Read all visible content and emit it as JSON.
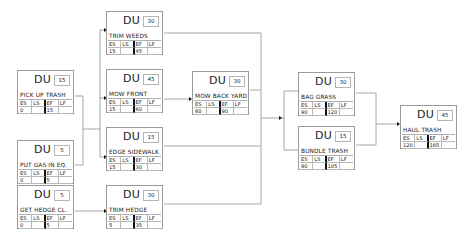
{
  "diagram": {
    "type": "activity-on-node network",
    "field_labels": {
      "du": "DU",
      "es": "ES",
      "ls": "LS",
      "ef": "EF",
      "lf": "LF"
    },
    "nodes": [
      {
        "id": "pick_up_trash",
        "name": "PICK UP TRASH",
        "du": "15",
        "es": "0",
        "ls": "",
        "ef": "15",
        "lf": "",
        "x": 17,
        "y": 70
      },
      {
        "id": "put_gas",
        "name": "PUT GAS IN EQ.",
        "du": "5",
        "es": "0",
        "ls": "",
        "ef": "5",
        "lf": "",
        "x": 17,
        "y": 140
      },
      {
        "id": "get_hedge",
        "name": "GET HEDGE CL.",
        "du": "5",
        "es": "0",
        "ls": "",
        "ef": "5",
        "lf": "",
        "x": 17,
        "y": 185
      },
      {
        "id": "trim_weeds",
        "name": "TRIM WEEDS",
        "du": "30",
        "es": "15",
        "ls": "",
        "ef": "45",
        "lf": "",
        "x": 106,
        "y": 11
      },
      {
        "id": "mow_front",
        "name": "MOW FRONT",
        "du": "45",
        "es": "15",
        "ls": "",
        "ef": "60",
        "lf": "",
        "x": 106,
        "y": 69
      },
      {
        "id": "edge_sidewalk",
        "name": "EDGE SIDEWALK",
        "du": "15",
        "es": "15",
        "ls": "",
        "ef": "30",
        "lf": "",
        "x": 106,
        "y": 127
      },
      {
        "id": "trim_hedge",
        "name": "TRIM HEDGE",
        "du": "30",
        "es": "5",
        "ls": "",
        "ef": "35",
        "lf": "",
        "x": 106,
        "y": 185
      },
      {
        "id": "mow_back_yard",
        "name": "MOW BACK YARD",
        "du": "30",
        "es": "60",
        "ls": "",
        "ef": "90",
        "lf": "",
        "x": 192,
        "y": 71
      },
      {
        "id": "bag_grass",
        "name": "BAG GRASS",
        "du": "30",
        "es": "90",
        "ls": "",
        "ef": "120",
        "lf": "",
        "x": 298,
        "y": 72
      },
      {
        "id": "bundle_trash",
        "name": "BUNDLE TRASH",
        "du": "15",
        "es": "90",
        "ls": "",
        "ef": "105",
        "lf": "",
        "x": 298,
        "y": 126
      },
      {
        "id": "haul_trash",
        "name": "HAUL TRASH",
        "du": "45",
        "es": "120",
        "ls": "",
        "ef": "165",
        "lf": "",
        "x": 400,
        "y": 105
      }
    ],
    "edges": [
      [
        "pick_up_trash",
        "trim_weeds"
      ],
      [
        "pick_up_trash",
        "mow_front"
      ],
      [
        "pick_up_trash",
        "edge_sidewalk"
      ],
      [
        "put_gas",
        "trim_weeds"
      ],
      [
        "put_gas",
        "mow_front"
      ],
      [
        "put_gas",
        "edge_sidewalk"
      ],
      [
        "get_hedge",
        "trim_hedge"
      ],
      [
        "mow_front",
        "mow_back_yard"
      ],
      [
        "trim_weeds",
        "bag_grass"
      ],
      [
        "trim_weeds",
        "bundle_trash"
      ],
      [
        "mow_back_yard",
        "bag_grass"
      ],
      [
        "mow_back_yard",
        "bundle_trash"
      ],
      [
        "edge_sidewalk",
        "bag_grass"
      ],
      [
        "edge_sidewalk",
        "bundle_trash"
      ],
      [
        "trim_hedge",
        "bag_grass"
      ],
      [
        "trim_hedge",
        "bundle_trash"
      ],
      [
        "bag_grass",
        "haul_trash"
      ],
      [
        "bundle_trash",
        "haul_trash"
      ]
    ],
    "colors": {
      "line": "#8a8a8a",
      "arrow": "#111111",
      "border": "#9a9a9a"
    }
  }
}
